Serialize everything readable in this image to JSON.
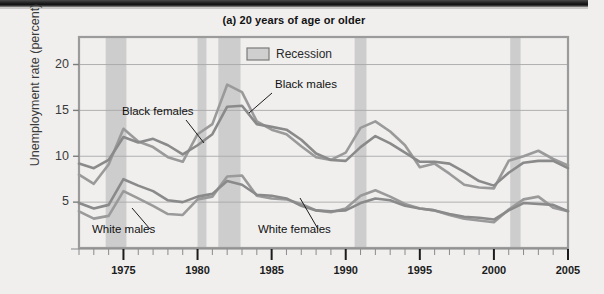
{
  "figure": {
    "title": "(a) 20 years of age or older",
    "ylabel": "Unemployment rate (percent)",
    "legend_label": "Recession"
  },
  "chart_data": {
    "type": "line",
    "title": "(a) 20 years of age or older",
    "xlabel": "",
    "ylabel": "Unemployment rate (percent)",
    "xlim": [
      1972,
      2005
    ],
    "ylim": [
      0,
      23
    ],
    "yticks": [
      5,
      10,
      15,
      20
    ],
    "ytick_labels": [
      "5",
      "10",
      "15",
      "20"
    ],
    "xticks": [
      1975,
      1980,
      1985,
      1990,
      1995,
      2000,
      2005
    ],
    "xtick_labels": [
      "1975",
      "1980",
      "1985",
      "1990",
      "1995",
      "2000",
      "2005"
    ],
    "minor_xtick_interval": 1,
    "grid": "horizontal",
    "legend": {
      "position": "top-center",
      "entries": [
        "Recession"
      ]
    },
    "x": [
      1972,
      1973,
      1974,
      1975,
      1976,
      1977,
      1978,
      1979,
      1980,
      1981,
      1982,
      1983,
      1984,
      1985,
      1986,
      1987,
      1988,
      1989,
      1990,
      1991,
      1992,
      1993,
      1994,
      1995,
      1996,
      1997,
      1998,
      1999,
      2000,
      2001,
      2002,
      2003,
      2004,
      2005
    ],
    "series": [
      {
        "name": "Black males",
        "color": "#9a9a9a",
        "values": [
          8.0,
          7.0,
          9.1,
          13.0,
          11.6,
          11.0,
          9.9,
          9.4,
          12.4,
          13.5,
          17.8,
          17.0,
          13.8,
          12.9,
          12.4,
          11.1,
          9.9,
          9.6,
          10.4,
          13.1,
          13.8,
          12.7,
          11.2,
          8.8,
          9.2,
          8.1,
          6.9,
          6.6,
          6.5,
          9.5,
          10.0,
          10.6,
          9.7,
          9.0
        ],
        "style": "light-gray"
      },
      {
        "name": "Black females",
        "color": "#8a8a8a",
        "values": [
          9.2,
          8.7,
          9.6,
          12.1,
          11.5,
          11.9,
          11.2,
          10.2,
          11.2,
          12.4,
          15.4,
          15.5,
          13.5,
          13.2,
          12.9,
          11.8,
          10.3,
          9.6,
          9.5,
          11.0,
          12.2,
          11.4,
          10.4,
          9.4,
          9.4,
          9.2,
          8.3,
          7.3,
          6.8,
          8.2,
          9.3,
          9.5,
          9.5,
          8.7
        ],
        "style": "dark-gray"
      },
      {
        "name": "White males",
        "color": "#9a9a9a",
        "values": [
          4.0,
          3.2,
          3.5,
          6.2,
          5.4,
          4.6,
          3.7,
          3.6,
          5.3,
          5.6,
          7.8,
          7.9,
          5.7,
          5.4,
          5.3,
          4.8,
          4.1,
          3.9,
          4.3,
          5.7,
          6.3,
          5.6,
          4.8,
          4.3,
          4.1,
          3.6,
          3.2,
          3.0,
          2.8,
          4.2,
          5.3,
          5.6,
          4.4,
          4.0
        ],
        "style": "light-gray"
      },
      {
        "name": "White females",
        "color": "#8a8a8a",
        "values": [
          4.9,
          4.3,
          4.7,
          7.5,
          6.8,
          6.2,
          5.2,
          5.0,
          5.6,
          5.9,
          7.3,
          6.9,
          5.8,
          5.7,
          5.4,
          4.6,
          4.1,
          4.0,
          4.1,
          4.9,
          5.4,
          5.2,
          4.6,
          4.3,
          4.1,
          3.7,
          3.4,
          3.3,
          3.1,
          4.1,
          4.9,
          4.8,
          4.7,
          4.0
        ],
        "style": "dark-gray"
      }
    ],
    "recession_bands": [
      {
        "start": 1973.8,
        "end": 1975.2
      },
      {
        "start": 1980.0,
        "end": 1980.6
      },
      {
        "start": 1981.4,
        "end": 1982.9
      },
      {
        "start": 1990.6,
        "end": 1991.4
      },
      {
        "start": 2001.1,
        "end": 2001.8
      }
    ],
    "annotations": [
      {
        "text": "Black males",
        "x": 275,
        "y": 88
      },
      {
        "text": "Black females",
        "x": 122,
        "y": 115
      },
      {
        "text": "White males",
        "x": 92,
        "y": 233
      },
      {
        "text": "White females",
        "x": 258,
        "y": 233
      }
    ]
  }
}
